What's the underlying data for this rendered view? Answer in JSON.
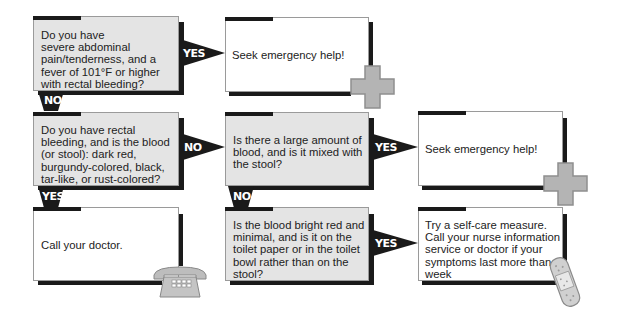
{
  "diagram": {
    "type": "decision-flowchart",
    "nodes": [
      {
        "id": "q1",
        "kind": "question",
        "text": "Do you have severe abdominal pain/tenderness, and a fever of 101°F or higher with rectal bleeding?",
        "lines": [
          "Do you have",
          "severe abdominal",
          "pain/tenderness, and a",
          "fever of 101°F or higher",
          "with rectal bleeding?"
        ]
      },
      {
        "id": "a1",
        "kind": "answer",
        "text": "Seek emergency help!",
        "icon": "medical-cross-icon"
      },
      {
        "id": "q2",
        "kind": "question",
        "text": "Do you have rectal bleeding, and is the blood (or stool): dark red, burgundy-colored, black, tar-like, or rust-colored?",
        "lines": [
          "Do you have rectal",
          "bleeding, and is the blood",
          "(or stool): dark red,",
          "burgundy-colored, black,",
          "tar-like, or rust-colored?"
        ]
      },
      {
        "id": "q3",
        "kind": "question",
        "text": "Is there a large amount of blood, and is it mixed with the stool?",
        "lines": [
          "Is there a large amount of",
          "blood, and is it mixed with",
          "the stool?"
        ]
      },
      {
        "id": "a2",
        "kind": "answer",
        "text": "Seek emergency help!",
        "icon": "medical-cross-icon"
      },
      {
        "id": "a3",
        "kind": "answer",
        "text": "Call your doctor.",
        "icon": "telephone-icon"
      },
      {
        "id": "q4",
        "kind": "question",
        "text": "Is the blood bright red and minimal, and is it on the toilet paper or in the toilet bowl rather than on the stool?",
        "lines": [
          "Is the blood bright red and",
          "minimal, and is it on the",
          "toilet paper or in the toilet",
          "bowl rather than on the",
          "stool?"
        ]
      },
      {
        "id": "a4",
        "kind": "answer",
        "text": "Try a self-care measure. Call your nurse information service or doctor if your symptoms last more than a week",
        "icon": "bandage-icon",
        "lines": [
          "Try a self-care measure.",
          "Call your nurse information",
          "service or doctor if your",
          "symptoms last more than a",
          "week"
        ]
      }
    ],
    "edges": [
      {
        "from": "q1",
        "to": "a1",
        "label": "YES"
      },
      {
        "from": "q1",
        "to": "q2",
        "label": "NO"
      },
      {
        "from": "q2",
        "to": "q3",
        "label": "NO"
      },
      {
        "from": "q2",
        "to": "a3",
        "label": "YES"
      },
      {
        "from": "q3",
        "to": "a2",
        "label": "YES"
      },
      {
        "from": "q3",
        "to": "q4",
        "label": "NO"
      },
      {
        "from": "q4",
        "to": "a4",
        "label": "YES"
      }
    ]
  },
  "labels": {
    "yes": "YES",
    "no": "NO"
  },
  "colors": {
    "question_fill": "#e4e4e4",
    "answer_fill": "#ffffff",
    "shadow": "#1a1a1a",
    "icon_grey": "#b4b4b4"
  }
}
